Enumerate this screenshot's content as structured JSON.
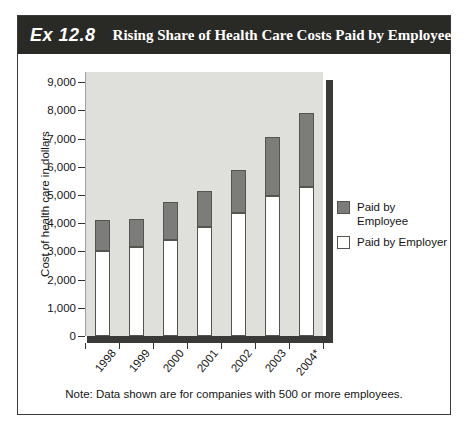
{
  "figure": {
    "exhibit_label": "Ex 12.8",
    "title": "Rising Share of Health Care Costs Paid by Employees",
    "note": "Note: Data shown are for companies with 500 or more employees."
  },
  "colors": {
    "header_bg": "#292926",
    "header_text": "#ffffff",
    "plot_bg": "#dfdfdc",
    "employee_fill": "#7c7c7a",
    "employer_fill": "#ffffff",
    "bar_border": "#55554f",
    "shadow": "#3a3a38"
  },
  "chart_data": {
    "type": "bar",
    "stacked": true,
    "title": "Rising Share of Health Care Costs Paid by Employees",
    "xlabel": "",
    "ylabel": "Cost of health care in dollars",
    "ylim": [
      0,
      9000
    ],
    "ytick_step": 1000,
    "yticks": [
      "9,000",
      "8,000",
      "7,000",
      "6,000",
      "5,000",
      "4,000",
      "3,000",
      "2,000",
      "1,000",
      "0"
    ],
    "grid": false,
    "legend_position": "right",
    "categories": [
      "1998",
      "1999",
      "2000",
      "2001",
      "2002",
      "2003",
      "2004*"
    ],
    "series": [
      {
        "name": "Paid by Employer",
        "color": "#ffffff",
        "values": [
          3000,
          3150,
          3400,
          3850,
          4350,
          4950,
          5300
        ]
      },
      {
        "name": "Paid by Employee",
        "color": "#7c7c7a",
        "values": [
          1100,
          1000,
          1350,
          1300,
          1550,
          2100,
          2600
        ]
      }
    ],
    "totals": [
      4100,
      4150,
      4750,
      5150,
      5900,
      7050,
      7900
    ],
    "legend": [
      {
        "label": "Paid by Employee",
        "swatch": "#7c7c7a"
      },
      {
        "label": "Paid by Employer",
        "swatch": "#ffffff"
      }
    ]
  }
}
